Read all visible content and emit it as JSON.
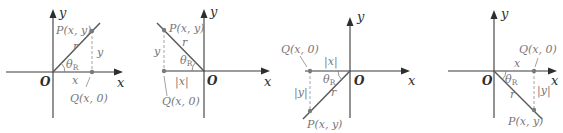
{
  "figure": {
    "colors": {
      "axis": "#3a3a3a",
      "ray": "#5a5a5a",
      "label": "#777777"
    },
    "panels": [
      {
        "quadrant": "I",
        "axis_x": "x",
        "axis_y": "y",
        "origin": "O",
        "point_p": "P(x, y)",
        "point_q": "Q(x, 0)",
        "radius": "r",
        "angle": "θ",
        "angle_sub": "R",
        "horizontal_leg": "x",
        "vertical_leg": "y"
      },
      {
        "quadrant": "II",
        "axis_x": "x",
        "axis_y": "y",
        "origin": "O",
        "point_p": "P(x, y)",
        "point_q": "Q(x, 0)",
        "radius": "r",
        "angle": "θ",
        "angle_sub": "R",
        "horizontal_leg": "|x|",
        "vertical_leg": "y"
      },
      {
        "quadrant": "III",
        "axis_x": "x",
        "axis_y": "y",
        "origin": "O",
        "point_p": "P(x, y)",
        "point_q": "Q(x, 0)",
        "radius": "r",
        "angle": "θ",
        "angle_sub": "R",
        "horizontal_leg": "|x|",
        "vertical_leg": "|y|"
      },
      {
        "quadrant": "IV",
        "axis_x": "x",
        "axis_y": "y",
        "origin": "O",
        "point_p": "P(x, y)",
        "point_q": "Q(x, 0)",
        "radius": "r",
        "angle": "θ",
        "angle_sub": "R",
        "horizontal_leg": "x",
        "vertical_leg": "|y|"
      }
    ]
  }
}
